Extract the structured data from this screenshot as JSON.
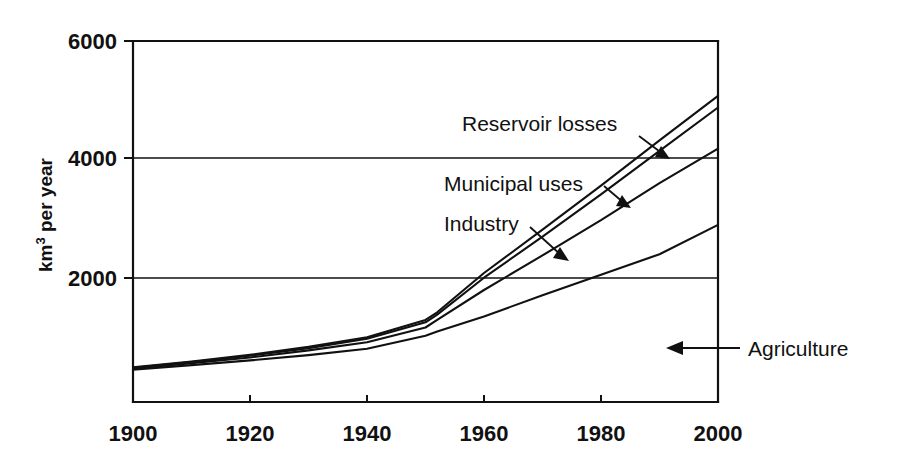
{
  "chart_data": {
    "type": "line",
    "title": "",
    "subtitle": "",
    "xlabel": "",
    "ylabel": "km³ per year",
    "ylabel_main": "km",
    "ylabel_sup": "3",
    "ylabel_tail": " per year",
    "xlim": [
      1900,
      2000
    ],
    "ylim": [
      0,
      6000
    ],
    "grid": "horizontal-at-y-ticks",
    "legend_position": "inline-annotations",
    "x_ticks": [
      1900,
      1920,
      1940,
      1960,
      1980,
      2000
    ],
    "x_tick_labels": [
      "1900",
      "1920",
      "1940",
      "1960",
      "1980",
      "2000"
    ],
    "y_ticks": [
      2000,
      4000,
      6000
    ],
    "y_tick_labels": [
      "2000",
      "4000",
      "6000"
    ],
    "x": [
      1900,
      1910,
      1920,
      1930,
      1940,
      1950,
      1952,
      1960,
      1970,
      1980,
      1990,
      2000
    ],
    "series": [
      {
        "name": "Agriculture",
        "label": "Agriculture",
        "description": "Lowest curve – cumulative agricultural water withdrawal",
        "values": [
          430,
          510,
          590,
          680,
          790,
          1010,
          1080,
          1340,
          1700,
          2050,
          2400,
          2900
        ]
      },
      {
        "name": "Industry",
        "label": "Industry",
        "description": "Agriculture + industry cumulative total",
        "values": [
          450,
          540,
          640,
          760,
          900,
          1150,
          1280,
          1790,
          2380,
          2980,
          3610,
          4200
        ]
      },
      {
        "name": "Municipal uses",
        "label": "Municipal uses",
        "description": "Agriculture + industry + municipal cumulative total",
        "values": [
          465,
          560,
          670,
          800,
          960,
          1240,
          1370,
          2000,
          2700,
          3420,
          4160,
          4900
        ]
      },
      {
        "name": "Reservoir losses",
        "label": "Reservoir losses",
        "description": "Total withdrawal including reservoir evaporation losses",
        "values": [
          470,
          570,
          685,
          820,
          985,
          1280,
          1410,
          2080,
          2820,
          3570,
          4340,
          5100
        ]
      }
    ],
    "annotations": [
      {
        "text": "Reservoir losses",
        "target_series": "Reservoir losses",
        "arrow": "down-right"
      },
      {
        "text": "Municipal uses",
        "target_series": "Municipal uses",
        "arrow": "down-right"
      },
      {
        "text": "Industry",
        "target_series": "Industry",
        "arrow": "down-right"
      },
      {
        "text": "Agriculture",
        "target_series": "Agriculture",
        "arrow": "left"
      }
    ]
  },
  "annotations": {
    "reservoir_losses": "Reservoir losses",
    "municipal_uses": "Municipal uses",
    "industry": "Industry",
    "agriculture": "Agriculture"
  },
  "axes": {
    "y_label_main": "km",
    "y_label_sup": "3",
    "y_label_tail": " per year",
    "y_tick_6000": "6000",
    "y_tick_4000": "4000",
    "y_tick_2000": "2000",
    "x_tick_1900": "1900",
    "x_tick_1920": "1920",
    "x_tick_1940": "1940",
    "x_tick_1960": "1960",
    "x_tick_1980": "1980",
    "x_tick_2000": "2000"
  },
  "colors": {
    "ink": "#111111",
    "background": "#ffffff"
  }
}
